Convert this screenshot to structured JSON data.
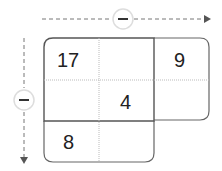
{
  "arrows": {
    "horizontal": {
      "operator": "−",
      "direction": "right"
    },
    "vertical": {
      "operator": "−",
      "direction": "down"
    }
  },
  "grid": {
    "cells": [
      {
        "row": 0,
        "col": 0,
        "value": "17"
      },
      {
        "row": 0,
        "col": 1,
        "value": ""
      },
      {
        "row": 0,
        "col": 2,
        "value": "9"
      },
      {
        "row": 1,
        "col": 0,
        "value": ""
      },
      {
        "row": 1,
        "col": 1,
        "value": "4"
      },
      {
        "row": 1,
        "col": 2,
        "value": ""
      },
      {
        "row": 2,
        "col": 0,
        "value": "8"
      },
      {
        "row": 2,
        "col": 1,
        "value": ""
      }
    ]
  },
  "colors": {
    "line": "#555555",
    "dotted": "#bbbbbb",
    "circle": "#dddddd"
  }
}
